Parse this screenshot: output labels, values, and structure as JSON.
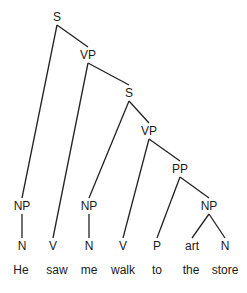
{
  "tree": {
    "nodes": {
      "s1": {
        "label": "S",
        "x": 57,
        "y": 17
      },
      "vp1": {
        "label": "VP",
        "x": 88,
        "y": 55
      },
      "s2": {
        "label": "S",
        "x": 129,
        "y": 93
      },
      "vp2": {
        "label": "VP",
        "x": 149,
        "y": 131
      },
      "pp": {
        "label": "PP",
        "x": 180,
        "y": 169
      },
      "np1": {
        "label": "NP",
        "x": 22,
        "y": 206
      },
      "np2": {
        "label": "NP",
        "x": 89,
        "y": 206
      },
      "np3": {
        "label": "NP",
        "x": 209,
        "y": 206
      },
      "n1": {
        "label": "N",
        "x": 22,
        "y": 246
      },
      "v1": {
        "label": "V",
        "x": 53,
        "y": 246
      },
      "n2": {
        "label": "N",
        "x": 89,
        "y": 246
      },
      "v2": {
        "label": "V",
        "x": 123,
        "y": 246
      },
      "p": {
        "label": "P",
        "x": 157,
        "y": 246
      },
      "art": {
        "label": "art",
        "x": 192,
        "y": 246
      },
      "n3": {
        "label": "N",
        "x": 225,
        "y": 246
      }
    },
    "words": {
      "w1": {
        "text": "He",
        "x": 21,
        "y": 270
      },
      "w2": {
        "text": "saw",
        "x": 57,
        "y": 270
      },
      "w3": {
        "text": "me",
        "x": 89,
        "y": 270
      },
      "w4": {
        "text": "walk",
        "x": 123,
        "y": 270
      },
      "w5": {
        "text": "to",
        "x": 157,
        "y": 270
      },
      "w6": {
        "text": "the",
        "x": 191,
        "y": 270
      },
      "w7": {
        "text": "store",
        "x": 225,
        "y": 270
      }
    },
    "edges": [
      [
        "s1",
        "np1"
      ],
      [
        "s1",
        "vp1"
      ],
      [
        "vp1",
        "v1"
      ],
      [
        "vp1",
        "s2"
      ],
      [
        "s2",
        "np2"
      ],
      [
        "s2",
        "vp2"
      ],
      [
        "vp2",
        "v2"
      ],
      [
        "vp2",
        "pp"
      ],
      [
        "pp",
        "p"
      ],
      [
        "pp",
        "np3"
      ],
      [
        "np3",
        "art"
      ],
      [
        "np3",
        "n3"
      ],
      [
        "np1",
        "n1"
      ],
      [
        "np2",
        "n2"
      ]
    ],
    "line_color": "#222222"
  }
}
